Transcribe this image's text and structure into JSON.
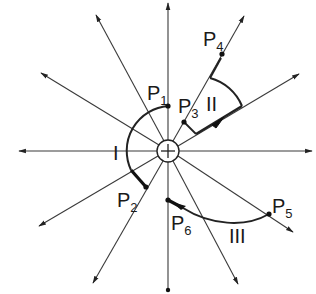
{
  "diagram": {
    "center": {
      "x": 168,
      "y": 151,
      "radius": 11,
      "symbol": "plus"
    },
    "line_color": "#333333",
    "points": [
      {
        "id": "P1",
        "label": "P",
        "sub": "1",
        "x": 168,
        "y": 106,
        "lx": 147,
        "ly": 100
      },
      {
        "id": "P2",
        "label": "P",
        "sub": "2",
        "x": 146,
        "y": 187,
        "lx": 117,
        "ly": 207
      },
      {
        "id": "P3",
        "label": "P",
        "sub": "3",
        "x": 184,
        "y": 122,
        "lx": 179,
        "ly": 113
      },
      {
        "id": "P4",
        "label": "P",
        "sub": "4",
        "x": 222,
        "y": 54,
        "lx": 205,
        "ly": 46
      },
      {
        "id": "P5",
        "label": "P",
        "sub": "5",
        "x": 269,
        "y": 214,
        "lx": 273,
        "ly": 215
      },
      {
        "id": "P6",
        "label": "P",
        "sub": "6",
        "x": 168,
        "y": 200,
        "lx": 172,
        "ly": 232
      }
    ],
    "regions": [
      {
        "id": "I",
        "label": "I",
        "x": 114,
        "y": 158
      },
      {
        "id": "II",
        "label": "II",
        "x": 208,
        "y": 109
      },
      {
        "id": "III",
        "label": "III",
        "x": 230,
        "y": 240
      }
    ]
  }
}
